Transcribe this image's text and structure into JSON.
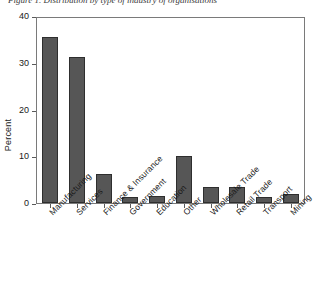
{
  "caption": "Figure 1. Distribution by type of industry of organisations",
  "chart_data": {
    "type": "bar",
    "title": "",
    "xlabel": "",
    "ylabel": "Percent",
    "ylim": [
      0,
      40
    ],
    "yticks": [
      0,
      10,
      20,
      30,
      40
    ],
    "ytick_labels": [
      "0",
      "10",
      "20",
      "30",
      "40"
    ],
    "grid": false,
    "legend": "none",
    "bar_color": "#565656",
    "bar_edge_color": "#2e2e2e",
    "axis_color": "#7a7a7a",
    "categories": [
      "Manufacturing",
      "Services",
      "Finance & Insurance",
      "Government",
      "Education",
      "Other",
      "Wholesale Trade",
      "Retail Trade",
      "Transport",
      "Mining"
    ],
    "values": [
      36,
      31.5,
      6.3,
      1.4,
      1.6,
      10.1,
      3.5,
      3.5,
      1.4,
      2.0
    ]
  }
}
